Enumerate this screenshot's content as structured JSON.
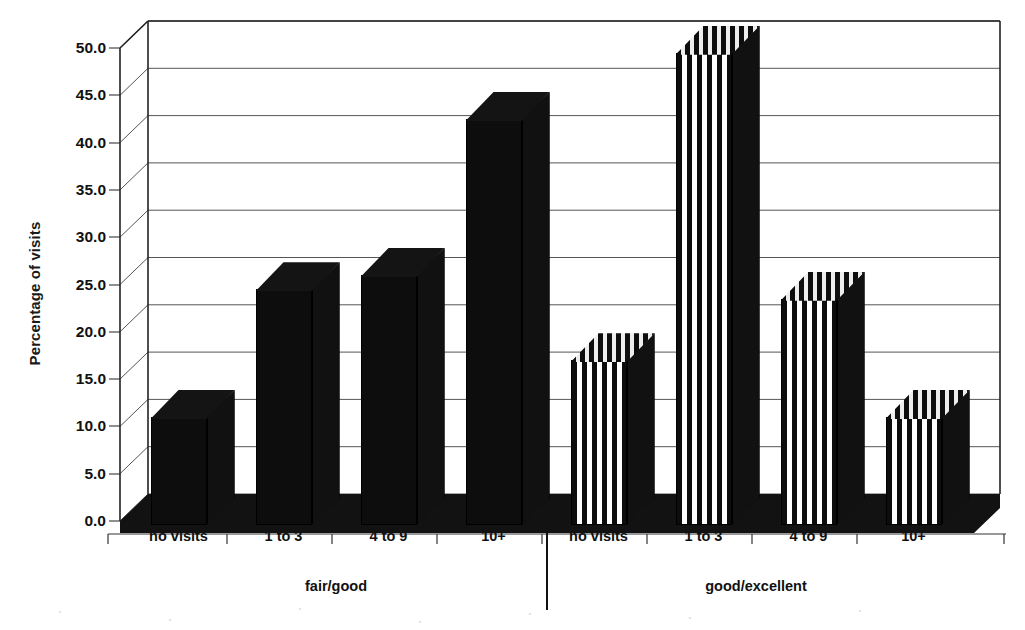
{
  "chart_data": {
    "type": "bar",
    "title": "",
    "subtitle": "",
    "xlabel": "",
    "ylabel": "Percentage of visits",
    "ylim": [
      0.0,
      50.0
    ],
    "ytick_step": 5.0,
    "ytick_labels": [
      "0.0",
      "5.0",
      "10.0",
      "15.0",
      "20.0",
      "25.0",
      "30.0",
      "35.0",
      "40.0",
      "45.0",
      "50.0"
    ],
    "ytick_values": [
      0.0,
      5.0,
      10.0,
      15.0,
      20.0,
      25.0,
      30.0,
      35.0,
      40.0,
      45.0,
      50.0
    ],
    "categories": [
      "no visits",
      "1 to 3",
      "4 to 9",
      "10+"
    ],
    "group_labels": [
      "fair/good",
      "good/excellent"
    ],
    "grid": true,
    "grid_axis": "y",
    "legend": false,
    "legend_position": "none",
    "style": "3d-bar",
    "series": [
      {
        "name": "fair/good",
        "fill": "solid-black",
        "values": [
          11.0,
          24.5,
          26.0,
          42.5
        ]
      },
      {
        "name": "good/excellent",
        "fill": "vertical-stripes",
        "values": [
          17.0,
          49.5,
          23.5,
          11.0
        ]
      }
    ],
    "bars": [
      {
        "group": "fair/good",
        "category": "no visits",
        "value": 11.0
      },
      {
        "group": "fair/good",
        "category": "1 to 3",
        "value": 24.5
      },
      {
        "group": "fair/good",
        "category": "4 to 9",
        "value": 26.0
      },
      {
        "group": "fair/good",
        "category": "10+",
        "value": 42.5
      },
      {
        "group": "good/excellent",
        "category": "no visits",
        "value": 17.0
      },
      {
        "group": "good/excellent",
        "category": "1 to 3",
        "value": 49.5
      },
      {
        "group": "good/excellent",
        "category": "4 to 9",
        "value": 23.5
      },
      {
        "group": "good/excellent",
        "category": "10+",
        "value": 11.0
      }
    ],
    "colors": {
      "bar_fill": "#0d0d0d",
      "bar_side": "#111111",
      "stripe_light": "#ffffff",
      "axis": "#222222",
      "grid": "#555555",
      "text": "#111111",
      "background": "#ffffff"
    }
  },
  "axis": {
    "y_title": "Percentage of visits"
  }
}
